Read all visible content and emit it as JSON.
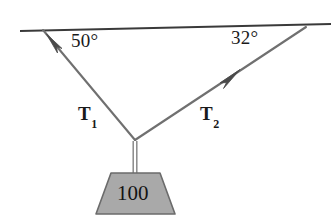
{
  "figure": {
    "type": "free-body-diagram",
    "background_color": "#ffffff"
  },
  "ceiling": {
    "name": "ceiling-line",
    "color": "#3a3a3a",
    "thickness": 2,
    "start": {
      "x": 20,
      "y": 31
    },
    "end": {
      "x": 331,
      "y": 24
    }
  },
  "knot": {
    "label": "knot-point",
    "x": 135,
    "y": 140
  },
  "angles": [
    {
      "id": "left",
      "text": "50°",
      "value": 50,
      "unit": "degrees",
      "measured_from": "ceiling",
      "side": "left"
    },
    {
      "id": "right",
      "text": "32°",
      "value": 32,
      "unit": "degrees",
      "measured_from": "ceiling",
      "side": "right"
    }
  ],
  "ropes": [
    {
      "id": "T1",
      "label_text": "T",
      "label_subscript": "1",
      "color": "#6e6e6e",
      "anchor": {
        "x": 43,
        "y": 30
      },
      "knot": {
        "x": 135,
        "y": 140
      },
      "arrow_at": {
        "x": 54,
        "y": 43
      },
      "direction": "up-left"
    },
    {
      "id": "T2",
      "label_text": "T",
      "label_subscript": "2",
      "color": "#6e6e6e",
      "anchor": {
        "x": 306,
        "y": 27
      },
      "knot": {
        "x": 135,
        "y": 140
      },
      "arrow_at": {
        "x": 230,
        "y": 77
      },
      "direction": "up-right"
    }
  ],
  "vertical_rope": {
    "name": "vertical-rope",
    "color": "#8e8e8e",
    "from": {
      "x": 135,
      "y": 140
    },
    "to": {
      "x": 135,
      "y": 174
    }
  },
  "weight": {
    "name": "hanging-weight",
    "value_text": "100",
    "value": 100,
    "shape": "trapezoid",
    "fill_color": "#a9a9a9",
    "stroke_color": "#6b6b6b",
    "top_left": {
      "x": 111,
      "y": 173
    },
    "top_right": {
      "x": 160,
      "y": 173
    },
    "bottom_right": {
      "x": 175,
      "y": 214
    },
    "bottom_left": {
      "x": 96,
      "y": 214
    }
  }
}
